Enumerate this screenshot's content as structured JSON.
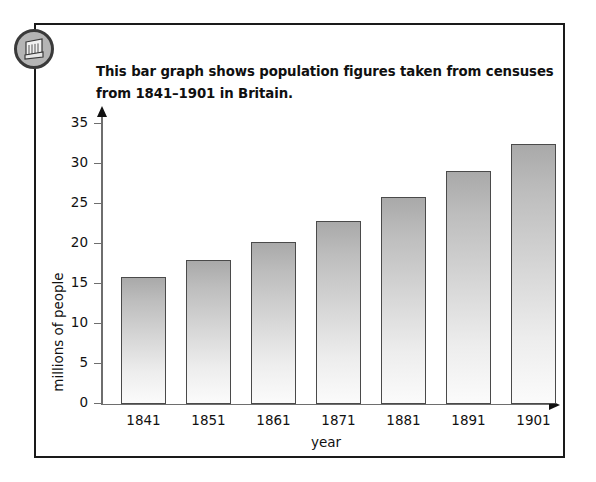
{
  "badge": {
    "icon": "book-graph-icon"
  },
  "caption": {
    "line1": "This bar graph shows population figures taken from censuses",
    "line2": "from 1841–1901 in Britain."
  },
  "chart_data": {
    "type": "bar",
    "title": "",
    "categories": [
      "1841",
      "1851",
      "1861",
      "1871",
      "1881",
      "1891",
      "1901"
    ],
    "values": [
      15.9,
      18.0,
      20.2,
      22.9,
      25.9,
      29.1,
      32.5
    ],
    "xlabel": "year",
    "ylabel": "millions of people",
    "ylim": [
      0,
      37
    ],
    "yticks": [
      0,
      5,
      10,
      15,
      20,
      25,
      30,
      35
    ],
    "ytick_labels": [
      "0",
      "5",
      "10",
      "15",
      "20",
      "25",
      "30",
      "35"
    ],
    "grid": false,
    "legend": null,
    "bar_fill_top": "#a9a9a9",
    "bar_fill_bottom": "#fbfbfb",
    "bar_stroke": "#4a4a4a",
    "axis_color": "#6e6e6e"
  }
}
